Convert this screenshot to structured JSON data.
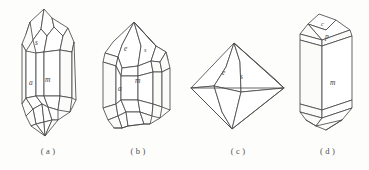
{
  "figure": {
    "background_color": "#fdfdfc",
    "line_color": "#4a4a4a",
    "label_color": "#40403f",
    "panels": [
      {
        "id": "a",
        "caption": "( a )",
        "description": "Elongated doubly-terminated prismatic crystal with steep pyramidal terminations",
        "face_labels": [
          {
            "symbol": "s",
            "x": 39,
            "y": 42
          },
          {
            "symbol": "a",
            "x": 33,
            "y": 82
          },
          {
            "symbol": "m",
            "x": 48,
            "y": 79
          }
        ]
      },
      {
        "id": "b",
        "caption": "( b )",
        "description": "Short prismatic crystal with rhombohedral and pyramidal terminal faces",
        "face_labels": [
          {
            "symbol": "e",
            "x": 39,
            "y": 48
          },
          {
            "symbol": "s",
            "x": 58,
            "y": 49
          },
          {
            "symbol": "a",
            "x": 33,
            "y": 88
          },
          {
            "symbol": "m",
            "x": 50,
            "y": 80
          }
        ]
      },
      {
        "id": "c",
        "caption": "( c )",
        "description": "Dipyramidal (bipyramid) crystal form",
        "face_labels": [
          {
            "symbol": "e",
            "x": 41,
            "y": 72
          },
          {
            "symbol": "s",
            "x": 58,
            "y": 76
          }
        ]
      },
      {
        "id": "d",
        "caption": "( d )",
        "description": "Stout prismatic crystal terminated by basal pinacoid and pyramid faces",
        "face_labels": [
          {
            "symbol": "c",
            "x": 38,
            "y": 24
          },
          {
            "symbol": "p",
            "x": 42,
            "y": 36
          },
          {
            "symbol": "m",
            "x": 39,
            "y": 82
          }
        ]
      }
    ]
  }
}
